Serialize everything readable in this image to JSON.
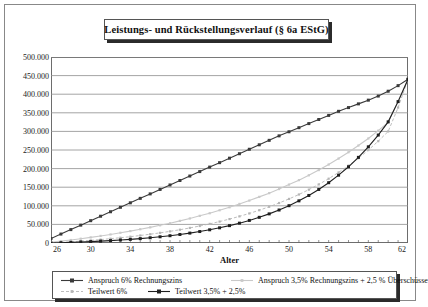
{
  "chart": {
    "title": "Leistungs- und Rückstellungsverlauf (§ 6a EStG)",
    "xlabel": "Alter",
    "ylabel": ""
  },
  "chart_data": {
    "type": "line",
    "title": "Leistungs- und Rückstellungsverlauf (§ 6a EStG)",
    "xlabel": "Alter",
    "ylabel": "",
    "xlim": [
      26,
      62
    ],
    "ylim": [
      0,
      500000
    ],
    "grid": true,
    "legend_position": "bottom",
    "x_tick_labels": [
      "26",
      "30",
      "34",
      "38",
      "42",
      "46",
      "50",
      "54",
      "58",
      "62"
    ],
    "x_tick_values": [
      26,
      30,
      34,
      38,
      42,
      46,
      50,
      54,
      58,
      62
    ],
    "y_tick_labels": [
      "0",
      "50.000",
      "100.000",
      "150.000",
      "200.000",
      "250.000",
      "300.000",
      "350.000",
      "400.000",
      "450.000",
      "500.000"
    ],
    "y_tick_values": [
      0,
      50000,
      100000,
      150000,
      200000,
      250000,
      300000,
      350000,
      400000,
      450000,
      500000
    ],
    "x": [
      26,
      27,
      28,
      29,
      30,
      31,
      32,
      33,
      34,
      35,
      36,
      37,
      38,
      39,
      40,
      41,
      42,
      43,
      44,
      45,
      46,
      47,
      48,
      49,
      50,
      51,
      52,
      53,
      54,
      55,
      56,
      57,
      58,
      59,
      60,
      61,
      62
    ],
    "series": [
      {
        "name": "Anspruch 6% Rechnungszins",
        "color": "#3a3a3a",
        "style": "solid",
        "marker": "square",
        "values": [
          12000,
          24000,
          36000,
          48000,
          60000,
          72000,
          84000,
          96000,
          108000,
          120000,
          132000,
          144000,
          156000,
          168000,
          180000,
          192000,
          204000,
          216000,
          228000,
          240000,
          252000,
          264000,
          276000,
          288000,
          299000,
          310000,
          321000,
          332000,
          343000,
          354000,
          364000,
          374000,
          384000,
          395000,
          408000,
          423000,
          440000
        ]
      },
      {
        "name": "Anspruch 3,5% Rechnungszins + 2,5 % Überschüsse",
        "color": "#c9c9c9",
        "style": "solid",
        "marker": "small-square",
        "values": [
          2000,
          5000,
          8000,
          11500,
          15000,
          19000,
          23000,
          27500,
          32000,
          37000,
          42000,
          47500,
          53000,
          59500,
          66000,
          73000,
          80000,
          88000,
          96000,
          105000,
          114000,
          124000,
          134000,
          145000,
          157000,
          169000,
          182000,
          196000,
          211000,
          227000,
          244000,
          262000,
          281000,
          302000,
          324000,
          381000,
          440000
        ]
      },
      {
        "name": "Teilwert 6%",
        "color": "#b5b5b5",
        "style": "dashed",
        "marker": "small-square",
        "values": [
          0,
          1500,
          3200,
          5000,
          7000,
          9200,
          11600,
          14200,
          17000,
          20200,
          23600,
          27300,
          31300,
          35700,
          40500,
          45700,
          51400,
          57600,
          64300,
          71600,
          79500,
          88100,
          97400,
          107500,
          118500,
          130400,
          143400,
          157500,
          172900,
          189700,
          208000,
          228000,
          249800,
          273700,
          299900,
          364000,
          440000
        ]
      },
      {
        "name": "Teilwert 3,5% + 2,5%",
        "color": "#1f1f1f",
        "style": "solid",
        "marker": "square",
        "values": [
          0,
          800,
          1700,
          2700,
          3800,
          5000,
          6400,
          8000,
          9800,
          11800,
          14100,
          16700,
          19600,
          22900,
          26600,
          30800,
          35500,
          40800,
          46700,
          53300,
          60700,
          69000,
          78300,
          88700,
          100300,
          113300,
          127800,
          144000,
          162100,
          182300,
          204900,
          230200,
          258500,
          290200,
          325700,
          380000,
          440000
        ]
      }
    ]
  },
  "legend": {
    "items": [
      {
        "label": "Anspruch 6% Rechnungszins"
      },
      {
        "label": "Anspruch 3,5% Rechnungszins + 2,5 % Überschüsse"
      },
      {
        "label": "Teilwert 6%"
      },
      {
        "label": "Teilwert 3,5% + 2,5%"
      }
    ]
  }
}
